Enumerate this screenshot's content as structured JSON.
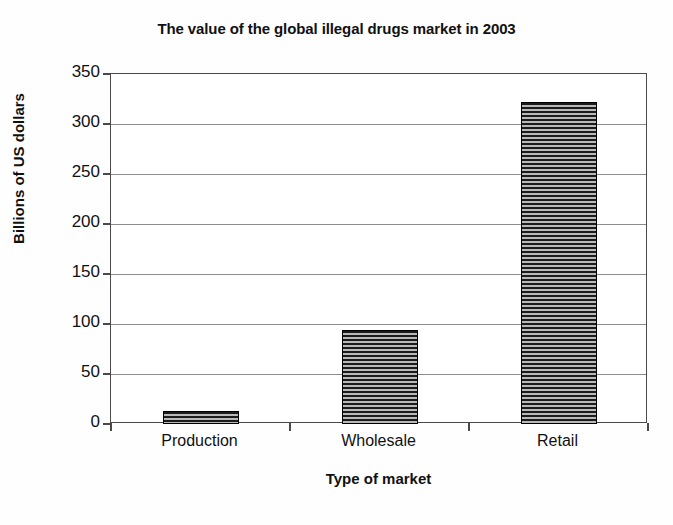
{
  "chart_data": {
    "type": "bar",
    "title": "The value of the global illegal drugs market in 2003",
    "xlabel": "Type of market",
    "ylabel": "Billions of US dollars",
    "categories": [
      "Production",
      "Wholesale",
      "Retail"
    ],
    "values": [
      13,
      94,
      322
    ],
    "ylim": [
      0,
      350
    ],
    "yticks": [
      0,
      50,
      100,
      150,
      200,
      250,
      300,
      350
    ],
    "ytick_labels": [
      "0",
      "50",
      "100",
      "150",
      "200",
      "250",
      "300",
      "350"
    ],
    "grid": true,
    "legend": "none",
    "series": [
      {
        "name": "Value",
        "values": [
          13,
          94,
          322
        ],
        "fill": "horizontal-stripe-hatch",
        "fill_color": "#8d8d8d",
        "edge_color": "#000000"
      }
    ],
    "colors": {
      "background": "#ffffff",
      "text": "#111111",
      "gridline": "#8c8c8c",
      "axis": "#4a4a4a",
      "bar_stripe_dark": "#1c1c1c",
      "bar_stripe_light": "#b9b9b9"
    }
  }
}
